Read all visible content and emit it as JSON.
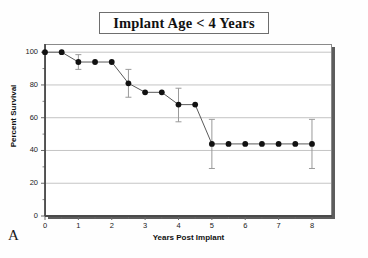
{
  "figure": {
    "panel_label": "A",
    "title": "Implant Age < 4 Years"
  },
  "chart_data": {
    "type": "line",
    "title": "Implant Age < 4 Years",
    "subtitle": "",
    "xlabel": "Years Post Implant",
    "ylabel": "Percent Survival",
    "xlim": [
      0,
      8.6
    ],
    "ylim": [
      0,
      105
    ],
    "xticks": [
      0,
      1,
      2,
      3,
      4,
      5,
      6,
      7,
      8
    ],
    "xtick_labels": [
      "0",
      "1",
      "2",
      "3",
      "4",
      "5",
      "6",
      "7",
      "8"
    ],
    "yticks": [
      0,
      20,
      40,
      60,
      80,
      100
    ],
    "ytick_labels": [
      "0",
      "20",
      "40",
      "60",
      "80",
      "100"
    ],
    "x_minor_ticks": [
      0.5,
      1.5,
      2.5,
      3.5,
      4.5,
      5.5,
      6.5,
      7.5
    ],
    "y_minor_ticks": [
      10,
      30,
      50,
      70,
      90
    ],
    "grid": "horizontal",
    "legend": "none",
    "marker": "filled-circle",
    "series": [
      {
        "name": "Percent Survival",
        "x": [
          0,
          0.5,
          1,
          1.5,
          2,
          2.5,
          3,
          3.5,
          4,
          4.5,
          5,
          5.5,
          6,
          6.5,
          7,
          7.5,
          8
        ],
        "values": [
          100,
          100,
          94,
          94,
          94,
          81,
          75.5,
          75.5,
          68,
          68,
          44,
          44,
          44,
          44,
          44,
          44,
          44
        ],
        "errorbars": [
          {
            "x": 1,
            "y": 94,
            "low": 89.5,
            "high": 98.5
          },
          {
            "x": 2.5,
            "y": 81,
            "low": 72.5,
            "high": 89.5
          },
          {
            "x": 4,
            "y": 68,
            "low": 57.5,
            "high": 78
          },
          {
            "x": 5,
            "y": 44,
            "low": 29,
            "high": 59
          },
          {
            "x": 8,
            "y": 44,
            "low": 29,
            "high": 59
          }
        ]
      }
    ]
  },
  "colors": {
    "marker": "#111111",
    "line": "#5a5a5a",
    "errorbar": "#9a9a9a",
    "grid": "#b5b5b5",
    "axis": "#6a6a6a",
    "frame_shadow": "#5d5d5d",
    "background": "#ffffff"
  }
}
